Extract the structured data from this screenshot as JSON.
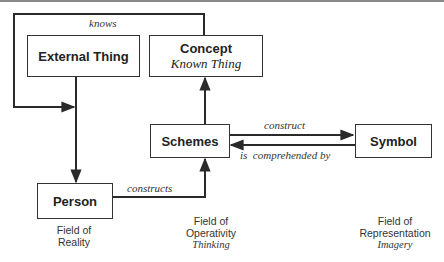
{
  "nodes": {
    "external_thing": {
      "title": "External Thing"
    },
    "concept": {
      "title": "Concept",
      "subtitle": "Known Thing"
    },
    "schemes": {
      "title": "Schemes"
    },
    "symbol": {
      "title": "Symbol"
    },
    "person": {
      "title": "Person"
    }
  },
  "edges": {
    "knows": "knows",
    "construct": "construct",
    "is_comprehended_by": "is  comprehended by",
    "constructs": "constructs"
  },
  "fields": {
    "reality": {
      "line1": "Field of",
      "line2": "Reality"
    },
    "operativity": {
      "line1": "Field of",
      "line2": "Operativity",
      "line3": "Thinking"
    },
    "representation": {
      "line1": "Field of",
      "line2": "Representation",
      "line3": "Imagery"
    }
  },
  "colors": {
    "line": "#2a2a2a",
    "box_border": "#333333",
    "top_bar": "#8a8a8a"
  }
}
